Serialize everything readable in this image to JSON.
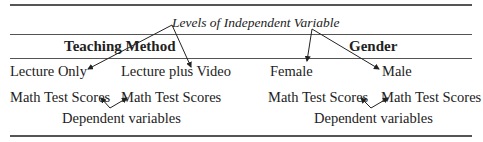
{
  "title_annotation": "Levels of Independent Variable",
  "groups": [
    {
      "header": "Teaching Method",
      "levels": [
        "Lecture Only",
        "Lecture plus Video"
      ],
      "scores": [
        "Math Test Scores",
        "Math Test Scores"
      ],
      "dependent_label": "Dependent variables"
    },
    {
      "header": "Gender",
      "levels": [
        "Female",
        "Male"
      ],
      "scores": [
        "Math Test Scores",
        "Math Test Scores"
      ],
      "dependent_label": "Dependent variables"
    }
  ]
}
